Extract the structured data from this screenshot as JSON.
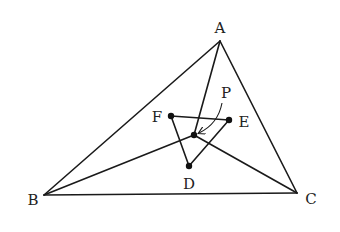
{
  "diagram": {
    "stroke_color": "#1a1a1a",
    "points": {
      "A": {
        "label": "A",
        "x": 220,
        "y": 41,
        "lx": 220,
        "ly": 33
      },
      "B": {
        "label": "B",
        "x": 44,
        "y": 195,
        "lx": 33,
        "ly": 205
      },
      "C": {
        "label": "C",
        "x": 297,
        "y": 193,
        "lx": 311,
        "ly": 204
      },
      "P": {
        "label": "P",
        "x": 194,
        "y": 135,
        "lx": 226,
        "ly": 98
      },
      "D": {
        "label": "D",
        "x": 189,
        "y": 166,
        "lx": 189,
        "ly": 189
      },
      "E": {
        "label": "E",
        "x": 229,
        "y": 120,
        "lx": 244,
        "ly": 127
      },
      "F": {
        "label": "F",
        "x": 171,
        "y": 116,
        "lx": 157,
        "ly": 122
      }
    },
    "segments": [
      "AB",
      "BC",
      "CA",
      "AP",
      "BP",
      "CP",
      "FE",
      "ED",
      "DF"
    ],
    "arrow": {
      "from_label": "P",
      "to_point": "P"
    }
  }
}
